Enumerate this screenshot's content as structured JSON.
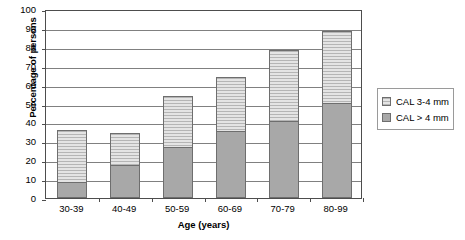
{
  "chart_data": {
    "type": "bar",
    "stacked": true,
    "title": "",
    "xlabel": "Age (years)",
    "ylabel": "Percentage of persons",
    "categories": [
      "30-39",
      "40-49",
      "50-59",
      "60-69",
      "70-79",
      "80-99"
    ],
    "ylim": [
      0,
      100
    ],
    "ytick_labels": [
      "0",
      "10",
      "20",
      "30",
      "40",
      "50",
      "60",
      "70",
      "80",
      "90",
      "100"
    ],
    "ytick_values": [
      0,
      10,
      20,
      30,
      40,
      50,
      60,
      70,
      80,
      90,
      100
    ],
    "grid": true,
    "legend_position": "right",
    "series": [
      {
        "name": "CAL > 4 mm",
        "color": "#a8a8a8",
        "pattern": "solid",
        "values": [
          8,
          17,
          26.5,
          35,
          40,
          50
        ]
      },
      {
        "name": "CAL 3-4 mm",
        "color": "#d9d9d9",
        "pattern": "horizontal-lines",
        "values": [
          27.5,
          17,
          27,
          28.5,
          38,
          38
        ]
      }
    ],
    "totals": [
      35.5,
      34,
      53.5,
      63.5,
      78,
      88
    ]
  },
  "legend": {
    "entries": [
      {
        "label": "CAL 3-4 mm",
        "swatch": "light"
      },
      {
        "label": "CAL > 4 mm",
        "swatch": "dark"
      }
    ]
  }
}
